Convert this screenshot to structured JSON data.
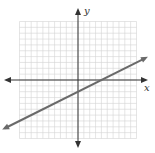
{
  "chart_data": {
    "type": "line",
    "title": "",
    "xlabel": "x",
    "ylabel": "y",
    "xlim": [
      -10,
      10
    ],
    "ylim": [
      -10,
      10
    ],
    "grid": true,
    "series": [
      {
        "name": "line",
        "slope": 0.5,
        "intercept": -2,
        "x": [
          -12.5,
          11.5
        ],
        "y": [
          -8.25,
          3.75
        ]
      }
    ],
    "colors": {
      "grid": "#d4d4d4",
      "axis": "#333333",
      "line": "#6a6a6a"
    }
  },
  "labels": {
    "x_axis": "x",
    "y_axis": "y"
  }
}
